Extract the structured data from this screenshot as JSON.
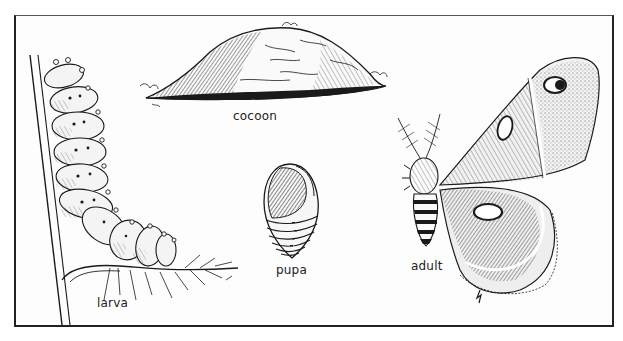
{
  "diagram": {
    "type": "life-cycle-illustration",
    "style": "black-and-white pen-and-ink engraving",
    "stages": [
      {
        "id": "larva",
        "label": "larva",
        "description": "segmented caterpillar with tubercles climbing a plant stem"
      },
      {
        "id": "cocoon",
        "label": "cocoon",
        "description": "elongated silk cocoon attached to a twig"
      },
      {
        "id": "pupa",
        "label": "pupa",
        "description": "segmented spindle-shaped pupa with wing case"
      },
      {
        "id": "adult",
        "label": "adult",
        "description": "moth with feathered antennae, banded abdomen, and eyespot on forewing"
      }
    ]
  },
  "labels": {
    "larva": "larva",
    "cocoon": "cocoon",
    "pupa": "pupa",
    "adult": "adult"
  },
  "colors": {
    "ink": "#1a1a1a",
    "paper": "#fdfdfd",
    "frame": "#222222"
  }
}
